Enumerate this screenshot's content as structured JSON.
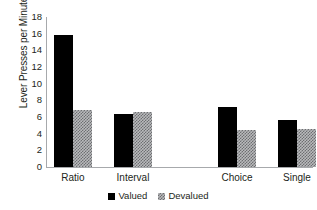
{
  "chart_data": {
    "type": "bar",
    "title": "",
    "subtitle": "",
    "xlabel": "",
    "ylabel": "Lever Presses per Minute",
    "categories": [
      "Ratio",
      "Interval",
      "Choice",
      "Single"
    ],
    "series": [
      {
        "name": "Valued",
        "values": [
          15.8,
          6.4,
          7.2,
          5.6
        ]
      },
      {
        "name": "Devalued",
        "values": [
          6.9,
          6.6,
          4.5,
          4.6
        ]
      }
    ],
    "ylim": [
      0,
      18
    ],
    "ytick_labels": [
      "18",
      "16",
      "14",
      "12",
      "10",
      "8",
      "6",
      "4",
      "2",
      "0"
    ],
    "ytick_values": [
      18,
      16,
      14,
      12,
      10,
      8,
      6,
      4,
      2,
      0
    ],
    "ytick_step": 2,
    "grid": false,
    "legend_position": "bottom-center",
    "group_gap_after": "Interval",
    "colors": {
      "valued": "#000000",
      "devalued_fill": "#b9babc",
      "devalued_hatch": "#6d6e71",
      "axis": "#a7a9ac",
      "text": "#231f20",
      "background": "#ffffff"
    }
  },
  "legend": {
    "entries": [
      {
        "label": "Valued",
        "swatch": "solid-black-square"
      },
      {
        "label": "Devalued",
        "swatch": "hatched-gray-square"
      }
    ]
  }
}
